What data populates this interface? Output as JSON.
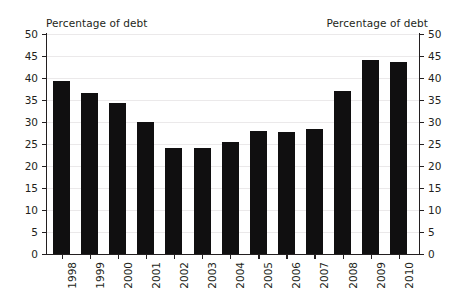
{
  "chart_data": {
    "type": "bar",
    "title": "",
    "left_axis_title": "Percentage of debt",
    "right_axis_title": "Percentage of debt",
    "xlabel": "",
    "ylabel": "Percentage of debt",
    "ylim": [
      0,
      50
    ],
    "ytick_interval": 5,
    "grid": true,
    "legend": "none",
    "bar_color": "#100f10",
    "categories": [
      "1998",
      "1999",
      "2000",
      "2001",
      "2002",
      "2003",
      "2004",
      "2005",
      "2006",
      "2007",
      "2008",
      "2009",
      "2010"
    ],
    "values": [
      39.3,
      36.7,
      34.4,
      29.9,
      24.2,
      24.0,
      25.5,
      28.0,
      27.7,
      28.4,
      37.0,
      44.2,
      43.7
    ],
    "ticks": [
      "0",
      "5",
      "10",
      "15",
      "20",
      "25",
      "30",
      "35",
      "40",
      "45",
      "50"
    ],
    "ytick_values": [
      0,
      5,
      10,
      15,
      20,
      25,
      30,
      35,
      40,
      45,
      50
    ]
  },
  "colors": {
    "bar": "#100f10",
    "axis": "#231f20",
    "grid": "#ebe9ea",
    "background": "#ffffff"
  }
}
